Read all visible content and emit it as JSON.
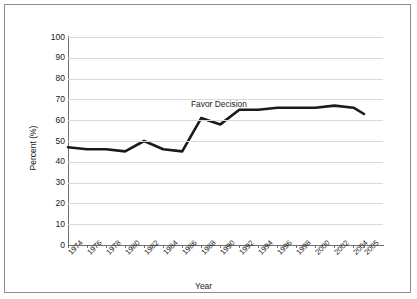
{
  "chart_data": {
    "type": "line",
    "title": "",
    "xlabel": "Year",
    "ylabel": "Percent (%)",
    "ylim": [
      0,
      100
    ],
    "ytick_labels": [
      "100",
      "90",
      "80",
      "70",
      "60",
      "50",
      "40",
      "30",
      "20",
      "10",
      "0"
    ],
    "ytick_values": [
      100,
      90,
      80,
      70,
      60,
      50,
      40,
      30,
      20,
      10,
      0
    ],
    "categories": [
      "1974",
      "1976",
      "1978",
      "1980",
      "1982",
      "1984",
      "1986",
      "1988",
      "1990",
      "1992",
      "1994",
      "1996",
      "1998",
      "2000",
      "2002",
      "2004",
      "2005"
    ],
    "series": [
      {
        "name": "Favor Decision",
        "values": [
          47,
          46,
          46,
          45,
          50,
          46,
          45,
          61,
          58,
          65,
          65,
          66,
          66,
          66,
          67,
          66,
          63
        ],
        "color": "#1a1a1a"
      }
    ],
    "annotations": [
      {
        "text": "Favor Decision",
        "x": "1988",
        "y": 72
      }
    ],
    "grid": true,
    "legend": "none",
    "line_color": "#1a1a1a",
    "grid_color": "#d9d9d9",
    "axis_color": "#6e6e6e"
  }
}
